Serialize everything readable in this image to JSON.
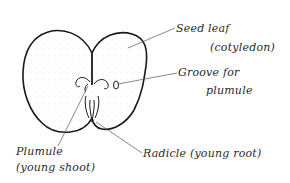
{
  "diagram": {
    "labels": {
      "seed_leaf": "Seed leaf",
      "cotyledon": "(cotyledon)",
      "groove_for": "Groove for",
      "groove_plumule": "plumule",
      "plumule": "Plumule",
      "young_shoot": "(young shoot)",
      "radicle": "Radicle (young root)"
    },
    "colors": {
      "outline": "#1a1a1a",
      "leader_line": "#555555",
      "background": "#ffffff"
    }
  }
}
